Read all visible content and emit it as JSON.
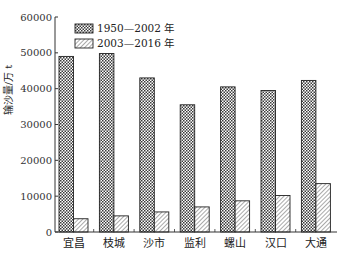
{
  "chart_data": {
    "type": "bar",
    "title": "",
    "xlabel": "",
    "ylabel": "输沙量/万 t",
    "ylim": [
      0,
      60000
    ],
    "yticks": [
      0,
      10000,
      20000,
      30000,
      40000,
      50000,
      60000
    ],
    "grid": false,
    "legend_position": "upper-left-inside",
    "categories": [
      "宜昌",
      "枝城",
      "沙市",
      "监利",
      "螺山",
      "汉口",
      "大通"
    ],
    "series": [
      {
        "name": "1950—2002 年",
        "pattern": "crosshatch",
        "values": [
          49000,
          49800,
          43000,
          35500,
          40500,
          39500,
          42300
        ]
      },
      {
        "name": "2003—2016 年",
        "pattern": "diagonal",
        "values": [
          3700,
          4500,
          5600,
          7000,
          8700,
          10200,
          13500
        ]
      }
    ]
  },
  "colors": {
    "axis": "#333333",
    "bar_stroke": "#222222",
    "pattern_ink": "#444444",
    "background": "#ffffff"
  }
}
